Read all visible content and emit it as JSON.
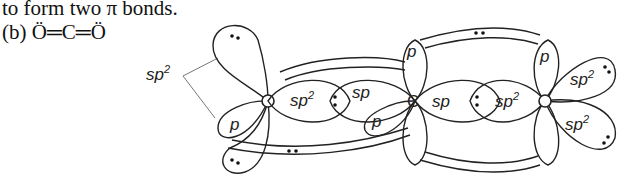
{
  "caption": {
    "line1": "to form two π bonds.",
    "line2_prefix": "(b) ",
    "molecule": "Ö═C═Ö"
  },
  "diagram": {
    "atoms": [
      {
        "symbol": "O",
        "hybridization": "sp2",
        "position": "left"
      },
      {
        "symbol": "C",
        "hybridization": "sp",
        "position": "center"
      },
      {
        "symbol": "O",
        "hybridization": "sp2",
        "position": "right"
      }
    ],
    "labels": {
      "left_callout": "sp",
      "left_callout_sup": "2",
      "left_p": "p",
      "left_sp2_bond": "sp",
      "left_sp2_bond_sup": "2",
      "center_sp_left": "sp",
      "center_p_left": "p",
      "center_c": "C",
      "center_p_top": "p",
      "center_sp_right": "sp",
      "right_sp2_bond": "sp",
      "right_sp2_bond_sup": "2",
      "right_p_top": "p",
      "right_sp2_upper": "sp",
      "right_sp2_upper_sup": "2",
      "right_sp2_lower": "sp",
      "right_sp2_lower_sup": "2",
      "lone_pair": "••",
      "bond_pair": ":"
    }
  }
}
